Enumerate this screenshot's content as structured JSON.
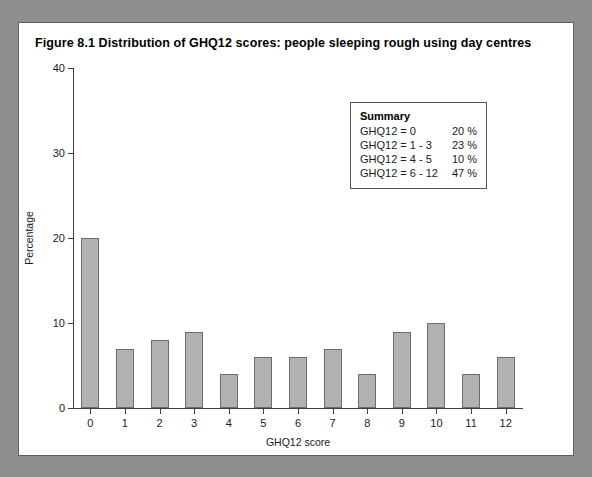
{
  "figure": {
    "title": "Figure 8.1  Distribution of GHQ12 scores: people sleeping rough using day centres"
  },
  "summary": {
    "heading": "Summary",
    "rows": [
      {
        "label": "GHQ12 = 0",
        "value": "20 %"
      },
      {
        "label": "GHQ12 = 1 - 3",
        "value": "23 %"
      },
      {
        "label": "GHQ12 = 4 - 5",
        "value": "10 %"
      },
      {
        "label": "GHQ12 = 6 - 12",
        "value": "47 %"
      }
    ]
  },
  "colors": {
    "bar_fill": "#b2b2b2",
    "bar_border": "#6b6b6b",
    "axis": "#404040",
    "frame": "#5d5d5d",
    "page_background": "#8e8e8e"
  },
  "chart_data": {
    "type": "bar",
    "title": "Figure 8.1  Distribution of GHQ12 scores: people sleeping rough using day centres",
    "xlabel": "GHQ12 score",
    "ylabel": "Percentage",
    "categories": [
      "0",
      "1",
      "2",
      "3",
      "4",
      "5",
      "6",
      "7",
      "8",
      "9",
      "10",
      "11",
      "12"
    ],
    "values": [
      20,
      7,
      8,
      9,
      4,
      6,
      6,
      7,
      4,
      9,
      10,
      4,
      6
    ],
    "ylim": [
      0,
      40
    ],
    "yticks": [
      0,
      10,
      20,
      30,
      40
    ],
    "ytick_labels": [
      "0",
      "10",
      "20",
      "30",
      "40"
    ],
    "grid": false,
    "legend": false,
    "annotations": [
      "Summary",
      "GHQ12 = 0   20 %",
      "GHQ12 = 1 - 3   23 %",
      "GHQ12 = 4 - 5   10 %",
      "GHQ12 = 6 - 12  47 %"
    ]
  }
}
